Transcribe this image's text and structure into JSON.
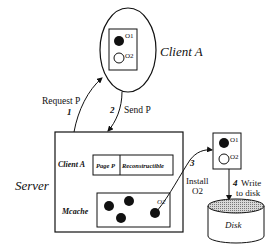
{
  "client": {
    "title": "Client A",
    "objects": [
      {
        "label": "O1",
        "filled": true
      },
      {
        "label": "O2",
        "filled": false
      }
    ]
  },
  "server": {
    "title": "Server",
    "client_row": {
      "label": "Client A",
      "cells": [
        "Page P",
        "Reconstructible"
      ]
    },
    "mcache": {
      "label": "Mcache",
      "object_label": "O2"
    }
  },
  "remote_page": {
    "objects": [
      {
        "label": "O1",
        "filled": true
      },
      {
        "label": "O2",
        "filled": false
      }
    ]
  },
  "disk": {
    "label": "Disk"
  },
  "steps": [
    {
      "num": "1",
      "text": "Request P"
    },
    {
      "num": "2",
      "text": "Send P"
    },
    {
      "num": "3",
      "text": "Install",
      "text2": "O2"
    },
    {
      "num": "4",
      "text": "Write",
      "text2": "to disk"
    }
  ],
  "colors": {
    "ink": "#111111",
    "disk_top": "#bdbdbd"
  }
}
